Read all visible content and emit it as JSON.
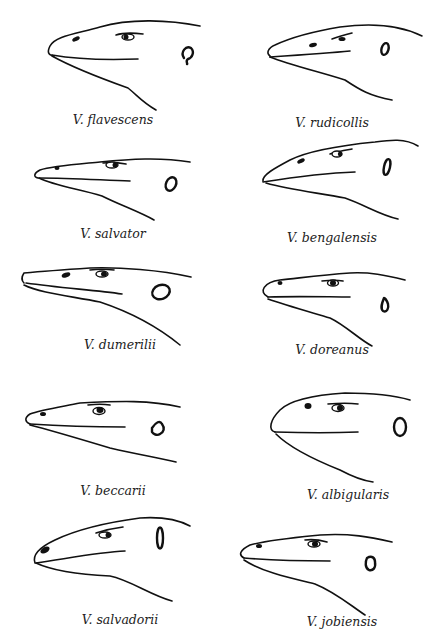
{
  "figure": {
    "panels": [
      {
        "row": 1,
        "col": 1,
        "label": "V. flavescens"
      },
      {
        "row": 1,
        "col": 2,
        "label": "V. rudicollis"
      },
      {
        "row": 2,
        "col": 1,
        "label": "V. salvator"
      },
      {
        "row": 2,
        "col": 2,
        "label": "V. bengalensis"
      },
      {
        "row": 3,
        "col": 1,
        "label": "V. dumerilii"
      },
      {
        "row": 3,
        "col": 2,
        "label": "V. doreanus"
      },
      {
        "row": 4,
        "col": 1,
        "label": "V. beccarii"
      },
      {
        "row": 4,
        "col": 2,
        "label": "V. albigularis"
      },
      {
        "row": 5,
        "col": 1,
        "label": "V. salvadorii"
      },
      {
        "row": 5,
        "col": 2,
        "label": "V. jobiensis"
      }
    ]
  }
}
